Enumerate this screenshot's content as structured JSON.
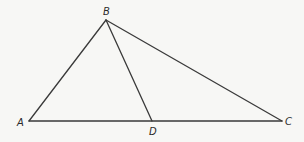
{
  "diagram": {
    "type": "triangle-with-cevian",
    "stroke_color": "#3a3a3a",
    "background": "#f7f7f5",
    "points": {
      "A": {
        "label": "A",
        "x": 29,
        "y": 121,
        "lx": 17,
        "ly": 126
      },
      "B": {
        "label": "B",
        "x": 106,
        "y": 20,
        "lx": 103,
        "ly": 15
      },
      "C": {
        "label": "C",
        "x": 282,
        "y": 121,
        "lx": 285,
        "ly": 125
      },
      "D": {
        "label": "D",
        "x": 152,
        "y": 121,
        "lx": 149,
        "ly": 135
      }
    },
    "segments": [
      {
        "from": "A",
        "to": "B"
      },
      {
        "from": "B",
        "to": "C"
      },
      {
        "from": "A",
        "to": "C"
      },
      {
        "from": "B",
        "to": "D"
      }
    ]
  }
}
